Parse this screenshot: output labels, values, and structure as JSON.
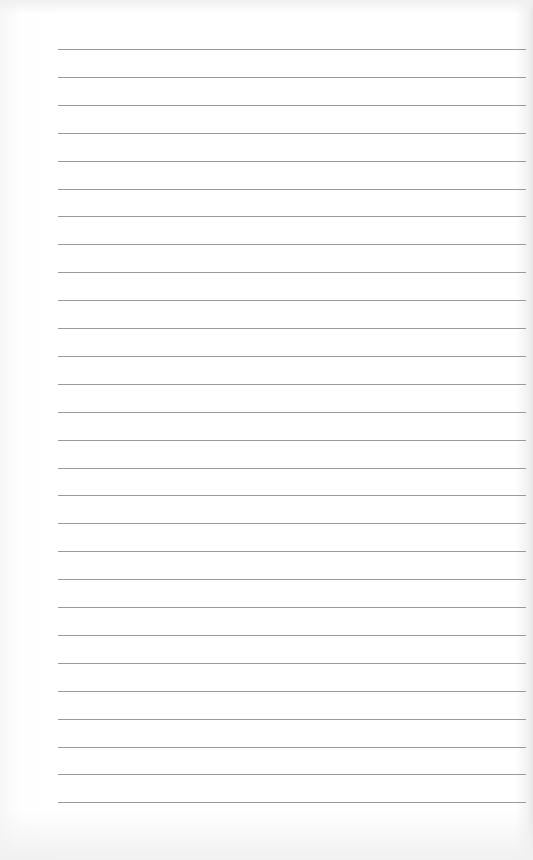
{
  "page": {
    "type": "lined-paper",
    "line_count": 28,
    "first_line_y": 49,
    "line_spacing": 27.9,
    "line_left": 58,
    "line_width": 468,
    "line_color": "#9a9a9a",
    "background_color": "#ffffff"
  }
}
